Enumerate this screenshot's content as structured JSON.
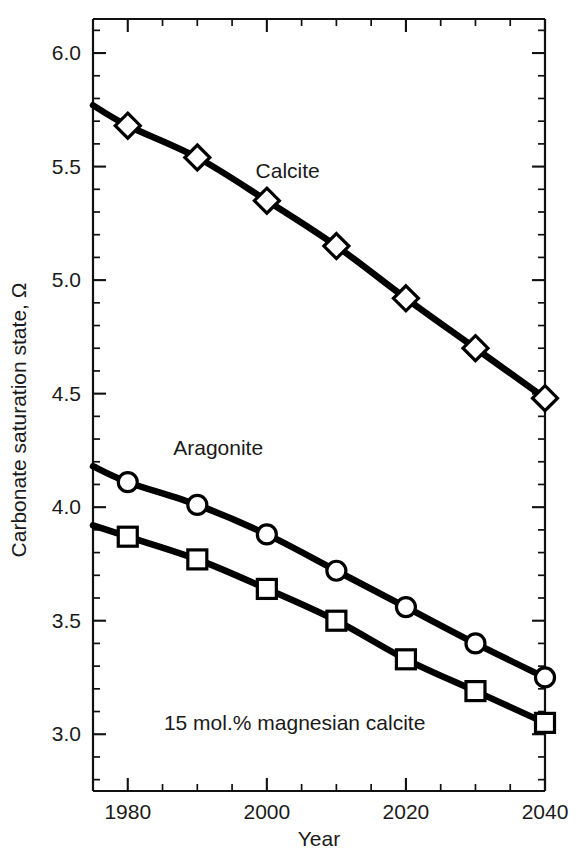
{
  "chart_data": {
    "type": "line",
    "title": "",
    "xlabel": "Year",
    "ylabel": "Carbonate saturation state, Ω",
    "xlim": [
      1975,
      2040
    ],
    "ylim": [
      2.75,
      6.15
    ],
    "xticks": [
      1980,
      2000,
      2020,
      2040
    ],
    "xtick_labels": [
      "1980",
      "2000",
      "2020",
      "2040"
    ],
    "xminor_step": 5,
    "yticks": [
      3.0,
      3.5,
      4.0,
      4.5,
      5.0,
      5.5,
      6.0
    ],
    "ytick_labels": [
      "3.0",
      "3.5",
      "4.0",
      "4.5",
      "5.0",
      "5.5",
      "6.0"
    ],
    "yminor_step": 0.1,
    "grid": false,
    "legend": "inline-annotations",
    "x": [
      1975,
      1980,
      1990,
      2000,
      2010,
      2020,
      2030,
      2040
    ],
    "series": [
      {
        "name": "Calcite",
        "marker": "diamond",
        "values": [
          5.77,
          5.68,
          5.54,
          5.35,
          5.15,
          4.92,
          4.7,
          4.48
        ],
        "annotation": {
          "text": "Calcite",
          "x": 2003,
          "y": 5.45
        }
      },
      {
        "name": "Aragonite",
        "marker": "circle",
        "values": [
          4.18,
          4.11,
          4.01,
          3.88,
          3.72,
          3.56,
          3.4,
          3.25
        ],
        "annotation": {
          "text": "Aragonite",
          "x": 1993,
          "y": 4.23
        }
      },
      {
        "name": "15 mol.% magnesian calcite",
        "marker": "square",
        "values": [
          3.92,
          3.87,
          3.77,
          3.64,
          3.5,
          3.33,
          3.19,
          3.05
        ],
        "annotation": {
          "text": "15 mol.% magnesian calcite",
          "x": 2004,
          "y": 3.02
        }
      }
    ],
    "colors": {
      "line": "#000000",
      "marker_fill": "#ffffff",
      "marker_stroke": "#000000",
      "axis": "#111111",
      "text": "#1a1a1a",
      "background": "#ffffff"
    }
  }
}
